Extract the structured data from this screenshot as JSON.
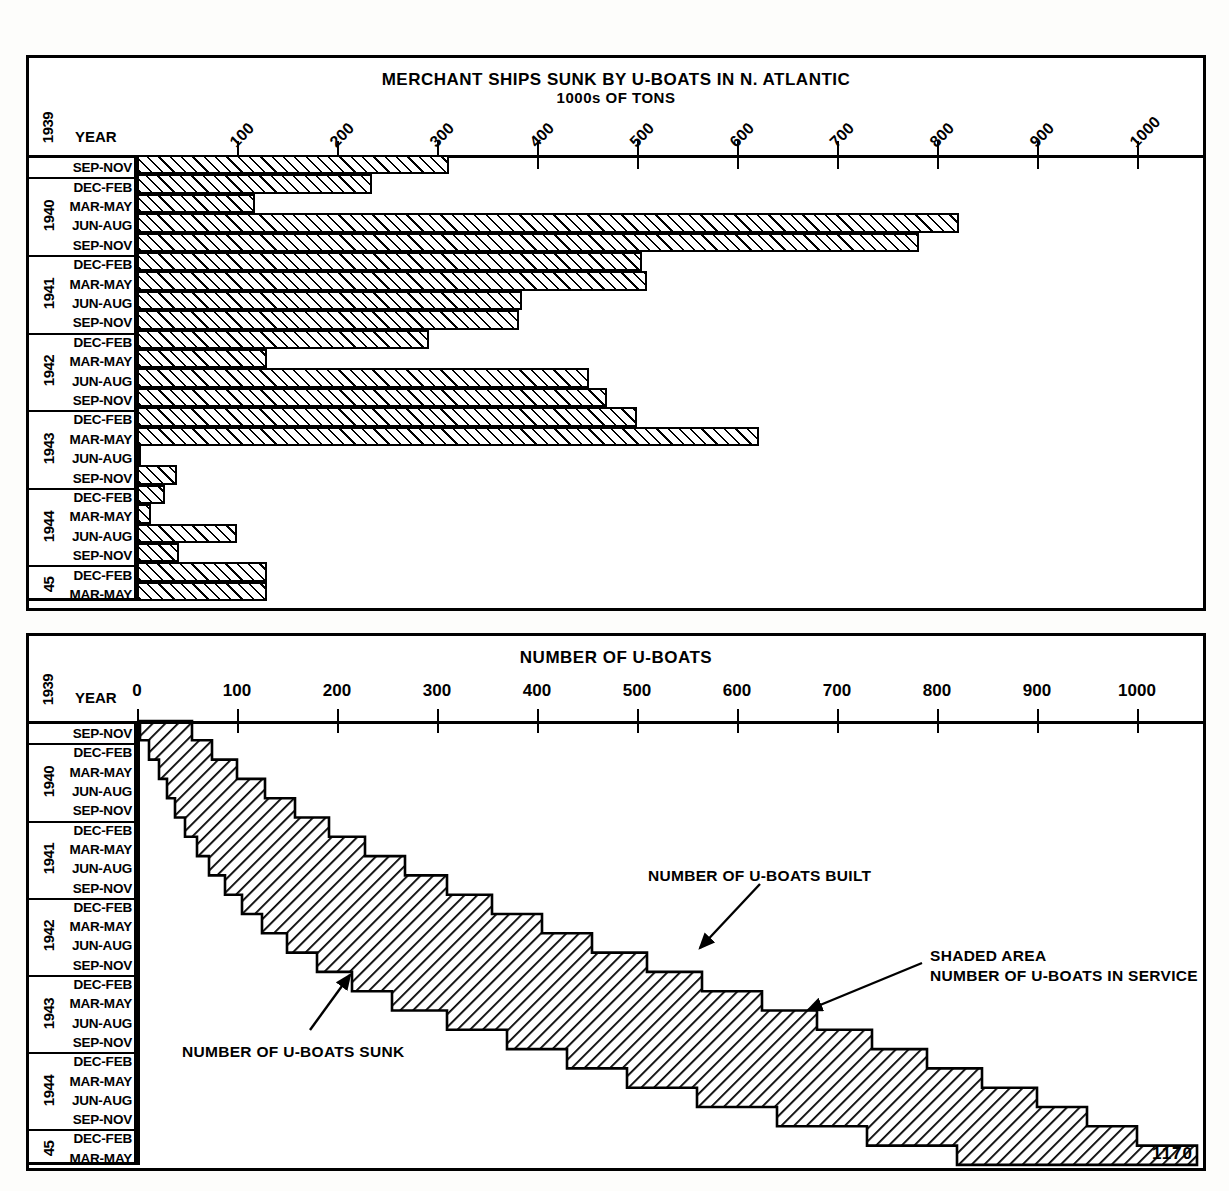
{
  "chart_data": [
    {
      "type": "bar",
      "orientation": "horizontal",
      "title": "MERCHANT SHIPS SUNK BY U-BOATS IN N. ATLANTIC",
      "subtitle": "1000s OF TONS",
      "xlabel": "1000s OF TONS",
      "ylabel": "Year",
      "year_header": "YEAR",
      "year_axis_start": "1939",
      "xlim": [
        0,
        1060
      ],
      "xticks": [
        100,
        200,
        300,
        400,
        500,
        600,
        700,
        800,
        900,
        1000
      ],
      "xticklabels": [
        "100",
        "200",
        "300",
        "400",
        "500",
        "600",
        "700",
        "800",
        "900",
        "1000"
      ],
      "grid": false,
      "categories": [
        "SEP-NOV",
        "DEC-FEB",
        "MAR-MAY",
        "JUN-AUG",
        "SEP-NOV",
        "DEC-FEB",
        "MAR-MAY",
        "JUN-AUG",
        "SEP-NOV",
        "DEC-FEB",
        "MAR-MAY",
        "JUN-AUG",
        "SEP-NOV",
        "DEC-FEB",
        "MAR-MAY",
        "JUN-AUG",
        "SEP-NOV",
        "DEC-FEB",
        "MAR-MAY",
        "JUN-AUG",
        "SEP-NOV",
        "DEC-FEB",
        "MAR-MAY"
      ],
      "values": [
        312,
        235,
        118,
        822,
        782,
        505,
        510,
        385,
        382,
        292,
        130,
        452,
        470,
        500,
        622,
        2,
        40,
        28,
        14,
        100,
        42,
        130,
        130
      ],
      "year_groups": [
        {
          "label": "1939",
          "rows": 1
        },
        {
          "label": "1940",
          "rows": 4
        },
        {
          "label": "1941",
          "rows": 4
        },
        {
          "label": "1942",
          "rows": 4
        },
        {
          "label": "1943",
          "rows": 4
        },
        {
          "label": "1944",
          "rows": 4
        },
        {
          "label": "45",
          "rows": 2
        }
      ]
    },
    {
      "type": "area",
      "title": "NUMBER OF U-BOATS",
      "xlabel": "NUMBER OF U-BOATS",
      "ylabel": "Year",
      "year_header": "YEAR",
      "year_axis_start": "1939",
      "xlim": [
        0,
        1060
      ],
      "xticks": [
        0,
        100,
        200,
        300,
        400,
        500,
        600,
        700,
        800,
        900,
        1000
      ],
      "xticklabels": [
        "0",
        "100",
        "200",
        "300",
        "400",
        "500",
        "600",
        "700",
        "800",
        "900",
        "1000"
      ],
      "grid": false,
      "categories": [
        "SEP-NOV",
        "DEC-FEB",
        "MAR-MAY",
        "JUN-AUG",
        "SEP-NOV",
        "DEC-FEB",
        "MAR-MAY",
        "JUN-AUG",
        "SEP-NOV",
        "DEC-FEB",
        "MAR-MAY",
        "JUN-AUG",
        "SEP-NOV",
        "DEC-FEB",
        "MAR-MAY",
        "JUN-AUG",
        "SEP-NOV",
        "DEC-FEB",
        "MAR-MAY",
        "JUN-AUG",
        "SEP-NOV",
        "DEC-FEB",
        "MAR-MAY"
      ],
      "series": [
        {
          "name": "NUMBER OF U-BOATS SUNK",
          "values": [
            3,
            12,
            22,
            30,
            38,
            48,
            60,
            72,
            88,
            105,
            125,
            150,
            180,
            215,
            255,
            310,
            370,
            430,
            490,
            560,
            640,
            730,
            820
          ]
        },
        {
          "name": "NUMBER OF U-BOATS BUILT",
          "values": [
            55,
            75,
            100,
            128,
            158,
            192,
            228,
            268,
            310,
            355,
            405,
            455,
            510,
            565,
            625,
            680,
            735,
            790,
            845,
            900,
            950,
            1000,
            1060
          ]
        }
      ],
      "year_groups": [
        {
          "label": "1939",
          "rows": 1
        },
        {
          "label": "1940",
          "rows": 4
        },
        {
          "label": "1941",
          "rows": 4
        },
        {
          "label": "1942",
          "rows": 4
        },
        {
          "label": "1943",
          "rows": 4
        },
        {
          "label": "1944",
          "rows": 4
        },
        {
          "label": "45",
          "rows": 2
        }
      ],
      "annotations": [
        {
          "text": "NUMBER OF U-BOATS BUILT",
          "x": 648,
          "y": 866
        },
        {
          "text": "NUMBER OF U-BOATS SUNK",
          "x": 182,
          "y": 1042
        },
        {
          "text": "SHADED AREA",
          "x": 930,
          "y": 946
        },
        {
          "text": "NUMBER OF U-BOATS IN SERVICE",
          "x": 930,
          "y": 966
        }
      ]
    }
  ],
  "corner_number": "1170",
  "colors": {
    "ink": "#000000",
    "paper": "#ffffff"
  }
}
